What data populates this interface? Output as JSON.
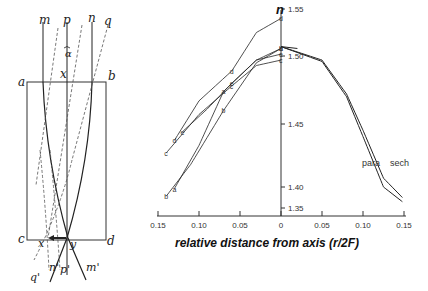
{
  "diagram": {
    "top_labels": [
      "m",
      "p",
      "n",
      "q"
    ],
    "angle_label": "α",
    "corner_labels": {
      "a": "a",
      "b": "b",
      "c": "c",
      "d": "d"
    },
    "top_point_label": "x",
    "bottom_left_point_label": "x",
    "bottom_right_point_label": "y",
    "bottom_labels": [
      "q'",
      "n'",
      "p'",
      "m'"
    ]
  },
  "chart_data": {
    "type": "line",
    "title": "",
    "xlabel": "relative distance from axis (r/2F)",
    "ylabel": "n",
    "x_ticks": [
      {
        "value": -0.15,
        "label": "0.15"
      },
      {
        "value": -0.1,
        "label": "0.10"
      },
      {
        "value": -0.05,
        "label": "0.05"
      },
      {
        "value": 0,
        "label": "0"
      },
      {
        "value": 0.05,
        "label": "0.05"
      },
      {
        "value": 0.1,
        "label": "0.10"
      },
      {
        "value": 0.15,
        "label": "0.15"
      }
    ],
    "y_ticks": [
      {
        "value": 1.55,
        "label": "1.55"
      },
      {
        "value": 1.5,
        "label": "1.50"
      },
      {
        "value": 1.45,
        "label": "1.45"
      },
      {
        "value": 1.4,
        "label": "1.40"
      },
      {
        "value": 1.35,
        "label": "1.35"
      }
    ],
    "xlim": [
      -0.15,
      0.15
    ],
    "ylim": [
      1.35,
      1.55
    ],
    "grid": false,
    "series": [
      {
        "name": "d",
        "points": [
          [
            -0.13,
            1.437
          ],
          [
            -0.1,
            1.467
          ],
          [
            -0.06,
            1.489
          ],
          [
            -0.03,
            1.525
          ],
          [
            0,
            1.54
          ]
        ]
      },
      {
        "name": "c",
        "points": [
          [
            -0.14,
            1.427
          ],
          [
            -0.1,
            1.457
          ],
          [
            -0.06,
            1.478
          ],
          [
            -0.03,
            1.493
          ],
          [
            0,
            1.497
          ]
        ]
      },
      {
        "name": "e",
        "points": [
          [
            -0.12,
            1.444
          ],
          [
            -0.09,
            1.461
          ],
          [
            -0.06,
            1.48
          ],
          [
            -0.03,
            1.497
          ],
          [
            0,
            1.502
          ]
        ]
      },
      {
        "name": "a",
        "points": [
          [
            -0.13,
            1.396
          ],
          [
            -0.1,
            1.433
          ],
          [
            -0.07,
            1.474
          ],
          [
            -0.03,
            1.497
          ],
          [
            0,
            1.508
          ]
        ]
      },
      {
        "name": "b",
        "points": [
          [
            -0.14,
            1.378
          ],
          [
            -0.11,
            1.418
          ],
          [
            -0.07,
            1.46
          ],
          [
            -0.03,
            1.495
          ],
          [
            0,
            1.508
          ]
        ]
      },
      {
        "name": "para",
        "points": [
          [
            0,
            1.51
          ],
          [
            0.05,
            1.496
          ],
          [
            0.08,
            1.47
          ],
          [
            0.1,
            1.44
          ],
          [
            0.125,
            1.4
          ],
          [
            0.148,
            1.365
          ]
        ]
      },
      {
        "name": "sech",
        "points": [
          [
            0,
            1.51
          ],
          [
            0.05,
            1.497
          ],
          [
            0.08,
            1.472
          ],
          [
            0.1,
            1.445
          ],
          [
            0.125,
            1.407
          ],
          [
            0.148,
            1.375
          ]
        ]
      }
    ],
    "annotations": [
      "para",
      "sech"
    ]
  }
}
